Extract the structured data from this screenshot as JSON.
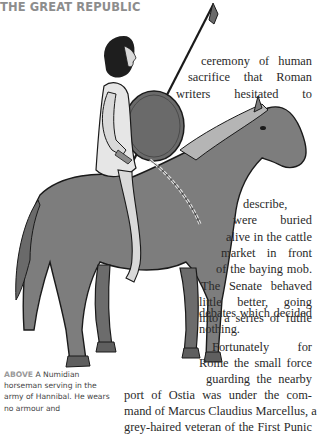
{
  "page": {
    "running_head": "THE GREAT REPUBLIC"
  },
  "illustration": {
    "subject": "Numidian horseman with spear and round shield on grey horse",
    "colors": {
      "horse": "#7d7d7d",
      "horse_dark": "#5f5f5f",
      "mane": "#b5b5b5",
      "shield": "#6a6a6a",
      "skin": "#d9d9d9",
      "tunic": "#e6e6e6",
      "hair": "#1e1e1e",
      "outline": "#1a1a1a"
    }
  },
  "article": {
    "lines": [
      "ceremony of human",
      "sacrifice that Roman",
      "writers  hesitated  to",
      "describe,",
      "were   buried",
      "alive in the cattle",
      "market  in  front",
      "of the baying mob.",
      "The Senate behaved",
      "little  better,  going",
      "into a series of futile",
      "debates which decided",
      "nothing.",
      "Fortunately    for",
      "Rome the small force",
      "guarding the nearby",
      "port of Ostia was  under  the  com-",
      "mand of Marcus Claudius Marcellus, a",
      "grey-haired veteran of the First Punic"
    ]
  },
  "caption": {
    "lead": "ABOVE",
    "text": " A Numidian horseman serving in the army of Hannibal. He wears no armour and"
  }
}
